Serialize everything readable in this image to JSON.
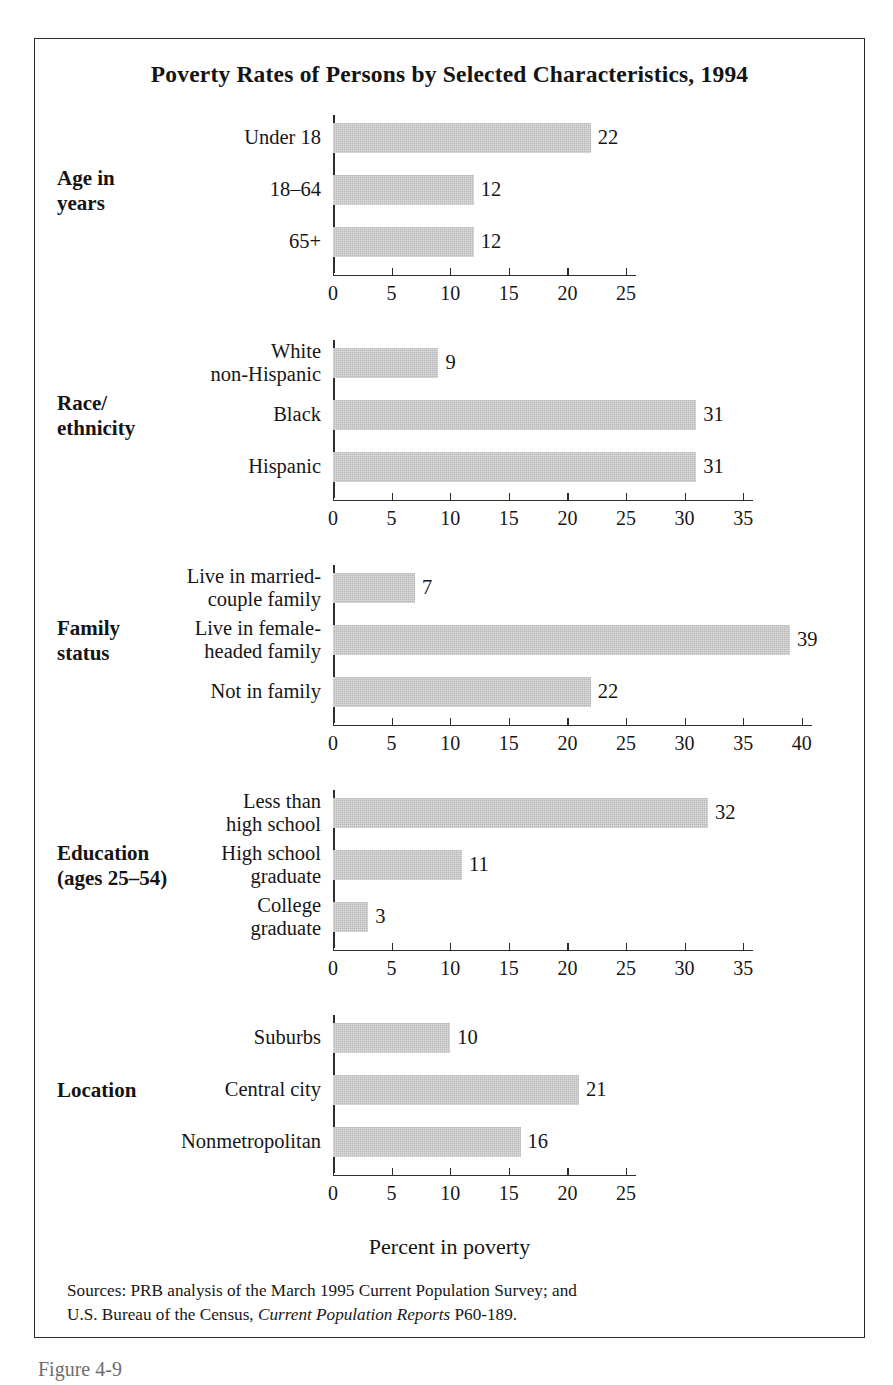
{
  "figure": {
    "title": "Poverty Rates of Persons by Selected Characteristics, 1994",
    "axis_caption": "Percent in poverty",
    "caption": "Figure 4-9",
    "sources_line1": "Sources: PRB analysis of the March 1995 Current Population Survey; and",
    "sources_line2_pre": "U.S. Bureau of the Census, ",
    "sources_line2_italic": "Current Population Reports",
    "sources_line2_post": " P60-189.",
    "bar_color": "#b9b9b9",
    "axis_color": "#2d2d2d",
    "frame_color": "#2a2a2a"
  },
  "chart_data": {
    "type": "bar",
    "orientation": "horizontal",
    "title": "Poverty Rates of Persons by Selected Characteristics, 1994",
    "xlabel": "Percent in poverty",
    "ylabel": "",
    "grid": false,
    "legend": null,
    "units": "percent",
    "panels": [
      {
        "group": "Age in\nyears",
        "group_lines": [
          "Age in",
          "years"
        ],
        "categories": [
          "Under 18",
          "18–64",
          "65+"
        ],
        "values": [
          22,
          12,
          12
        ],
        "xlim": [
          0,
          25
        ],
        "xticks": [
          0,
          5,
          10,
          15,
          20,
          25
        ]
      },
      {
        "group": "Race/\nethnicity",
        "group_lines": [
          "Race/",
          "ethnicity"
        ],
        "categories": [
          "White\nnon-Hispanic",
          "Black",
          "Hispanic"
        ],
        "values": [
          9,
          31,
          31
        ],
        "xlim": [
          0,
          35
        ],
        "xticks": [
          0,
          5,
          10,
          15,
          20,
          25,
          30,
          35
        ]
      },
      {
        "group": "Family\nstatus",
        "group_lines": [
          "Family",
          "status"
        ],
        "categories": [
          "Live in married-\ncouple family",
          "Live in female-\nheaded family",
          "Not in family"
        ],
        "values": [
          7,
          39,
          22
        ],
        "xlim": [
          0,
          40
        ],
        "xticks": [
          0,
          5,
          10,
          15,
          20,
          25,
          30,
          35,
          40
        ]
      },
      {
        "group": "Education\n(ages 25–54)",
        "group_lines": [
          "Education",
          "(ages 25–54)"
        ],
        "categories": [
          "Less than\nhigh school",
          "High school\ngraduate",
          "College\ngraduate"
        ],
        "values": [
          32,
          11,
          3
        ],
        "xlim": [
          0,
          35
        ],
        "xticks": [
          0,
          5,
          10,
          15,
          20,
          25,
          30,
          35
        ]
      },
      {
        "group": "Location",
        "group_lines": [
          "Location"
        ],
        "categories": [
          "Suburbs",
          "Central city",
          "Nonmetropolitan"
        ],
        "values": [
          10,
          21,
          16
        ],
        "xlim": [
          0,
          25
        ],
        "xticks": [
          0,
          5,
          10,
          15,
          20,
          25
        ]
      }
    ]
  }
}
